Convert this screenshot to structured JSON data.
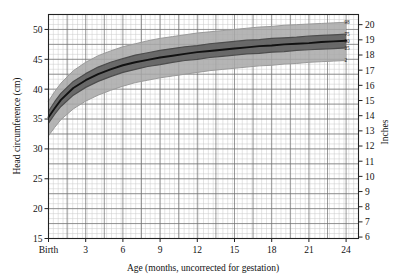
{
  "chart_data": {
    "type": "line",
    "title": "",
    "xlabel": "Age (months, uncorrected for gestation)",
    "ylabel": "Head circumference (cm)",
    "y2label": "Inches",
    "xlim": [
      0,
      25
    ],
    "ylim": [
      15,
      52.5
    ],
    "y2lim": [
      6,
      21
    ],
    "grid": true,
    "legend_position": "right-inline",
    "x_tick_labels": [
      "Birth",
      "3",
      "6",
      "9",
      "12",
      "15",
      "18",
      "21",
      "24"
    ],
    "x_tick_values": [
      0,
      3,
      6,
      9,
      12,
      15,
      18,
      21,
      24
    ],
    "y_tick_labels": [
      "15",
      "20",
      "25",
      "30",
      "35",
      "40",
      "45",
      "50"
    ],
    "y_tick_values": [
      15,
      20,
      25,
      30,
      35,
      40,
      45,
      50
    ],
    "y2_tick_labels": [
      "6",
      "7",
      "8",
      "9",
      "10",
      "11",
      "12",
      "13",
      "14",
      "15",
      "16",
      "17",
      "18",
      "19",
      "20",
      "21"
    ],
    "y2_tick_values": [
      6,
      7,
      8,
      9,
      10,
      11,
      12,
      13,
      14,
      15,
      16,
      17,
      18,
      19,
      20,
      21
    ],
    "x": [
      0,
      0.5,
      1,
      2,
      3,
      4,
      5,
      6,
      7,
      8,
      9,
      10,
      11,
      12,
      13,
      14,
      15,
      16,
      17,
      18,
      19,
      20,
      21,
      22,
      23,
      24
    ],
    "series": [
      {
        "name": "98",
        "label": "98",
        "color": "#9a9a9a",
        "values": [
          38.0,
          39.6,
          41.0,
          43.1,
          44.5,
          45.6,
          46.4,
          47.1,
          47.6,
          48.1,
          48.5,
          48.8,
          49.1,
          49.4,
          49.6,
          49.8,
          50.0,
          50.2,
          50.4,
          50.5,
          50.7,
          50.8,
          50.9,
          51.0,
          51.1,
          51.2
        ]
      },
      {
        "name": "75",
        "label": "75",
        "color": "#4d4d4d",
        "values": [
          36.3,
          37.9,
          39.3,
          41.3,
          42.6,
          43.7,
          44.5,
          45.1,
          45.7,
          46.1,
          46.5,
          46.8,
          47.1,
          47.3,
          47.6,
          47.8,
          48.0,
          48.2,
          48.3,
          48.5,
          48.6,
          48.7,
          48.9,
          49.0,
          49.1,
          49.2
        ]
      },
      {
        "name": "50",
        "label": "50",
        "color": "#111111",
        "values": [
          35.3,
          36.8,
          38.2,
          40.2,
          41.5,
          42.5,
          43.3,
          44.0,
          44.5,
          44.9,
          45.3,
          45.6,
          45.9,
          46.2,
          46.4,
          46.6,
          46.8,
          47.0,
          47.2,
          47.3,
          47.5,
          47.6,
          47.7,
          47.9,
          48.0,
          48.1
        ]
      },
      {
        "name": "25",
        "label": "25",
        "color": "#4d4d4d",
        "values": [
          34.3,
          35.8,
          37.1,
          39.0,
          40.3,
          41.3,
          42.1,
          42.8,
          43.3,
          43.8,
          44.1,
          44.5,
          44.8,
          45.0,
          45.3,
          45.5,
          45.7,
          45.9,
          46.0,
          46.2,
          46.3,
          46.5,
          46.6,
          46.7,
          46.8,
          46.9
        ]
      },
      {
        "name": "2",
        "label": "2",
        "color": "#9a9a9a",
        "values": [
          32.2,
          33.6,
          34.9,
          36.7,
          38.0,
          39.0,
          39.8,
          40.5,
          41.1,
          41.5,
          41.9,
          42.2,
          42.5,
          42.8,
          43.1,
          43.3,
          43.5,
          43.7,
          43.9,
          44.0,
          44.2,
          44.3,
          44.5,
          44.6,
          44.7,
          44.8
        ]
      }
    ],
    "bands": [
      {
        "name": "2-98",
        "lower": "2",
        "upper": "98",
        "fill": "#a8a8a8"
      },
      {
        "name": "25-75",
        "lower": "25",
        "upper": "75",
        "fill": "#5c5c5c"
      }
    ]
  }
}
